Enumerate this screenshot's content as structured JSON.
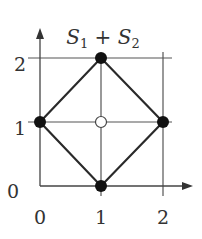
{
  "title": {
    "main1": "S",
    "sub1": "1",
    "plus": " + ",
    "main2": "S",
    "sub2": "2"
  },
  "axes": {
    "x_ticks": [
      "0",
      "1",
      "2"
    ],
    "y_ticks": [
      "0",
      "1",
      "2"
    ]
  },
  "diagram": {
    "type": "lattice polytope (Minkowski sum)",
    "filled_vertices": [
      [
        0,
        1
      ],
      [
        1,
        2
      ],
      [
        2,
        1
      ],
      [
        1,
        0
      ]
    ],
    "open_point": [
      1,
      1
    ],
    "edges": [
      [
        [
          0,
          1
        ],
        [
          1,
          2
        ]
      ],
      [
        [
          1,
          2
        ],
        [
          2,
          1
        ]
      ],
      [
        [
          2,
          1
        ],
        [
          1,
          0
        ]
      ],
      [
        [
          1,
          0
        ],
        [
          0,
          1
        ]
      ]
    ],
    "grid_lines": {
      "x": [
        1,
        2
      ],
      "y": [
        1,
        2
      ]
    }
  }
}
